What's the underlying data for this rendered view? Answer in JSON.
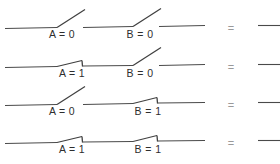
{
  "figure": {
    "width": 280,
    "height": 164,
    "background": "#ffffff",
    "wire_color": "#4a4a4a",
    "label_color": "#2e2e2e",
    "equals_color": "#9a9a9a"
  },
  "rows": [
    {
      "id": "row-1",
      "baseline_y": 28,
      "switch_a": {
        "label": "A = 0",
        "state": "open",
        "value": 0,
        "label_x": 62,
        "label_y": 38
      },
      "switch_b": {
        "label": "B = 0",
        "state": "open",
        "value": 1,
        "label_x": 140,
        "label_y": 38
      },
      "equals": "=",
      "equals_x": 231,
      "output_value": 0
    },
    {
      "id": "row-2",
      "baseline_y": 67,
      "switch_a": {
        "label": "A = 1",
        "state": "closed",
        "value": 1,
        "label_x": 72,
        "label_y": 77
      },
      "switch_b": {
        "label": "B = 0",
        "state": "open",
        "value": 0,
        "label_x": 140,
        "label_y": 77
      },
      "equals": "=",
      "equals_x": 231,
      "output_value": 0
    },
    {
      "id": "row-3",
      "baseline_y": 105,
      "switch_a": {
        "label": "A = 0",
        "state": "open",
        "value": 0,
        "label_x": 62,
        "label_y": 115
      },
      "switch_b": {
        "label": "B = 1",
        "state": "closed",
        "value": 1,
        "label_x": 148,
        "label_y": 115
      },
      "equals": "=",
      "equals_x": 231,
      "output_value": 0
    },
    {
      "id": "row-4",
      "baseline_y": 143,
      "switch_a": {
        "label": "A = 1",
        "state": "closed",
        "value": 1,
        "label_x": 72,
        "label_y": 153
      },
      "switch_b": {
        "label": "B = 1",
        "state": "closed",
        "value": 1,
        "label_x": 148,
        "label_y": 153
      },
      "equals": "=",
      "equals_x": 231,
      "output_value": 1
    }
  ],
  "geometry": {
    "left_wire_start": 5,
    "switch_a_pivot": 57,
    "switch_a_contact": 83,
    "mid_wire_start": 83,
    "switch_b_pivot": 133,
    "switch_b_contact": 158,
    "right_wire_end": 205,
    "output_wire_start": 258,
    "output_wire_end": 280,
    "open_blade_dx": 28,
    "open_blade_dy": -18,
    "closed_blade_rise": 6,
    "contact_drop": 6
  }
}
